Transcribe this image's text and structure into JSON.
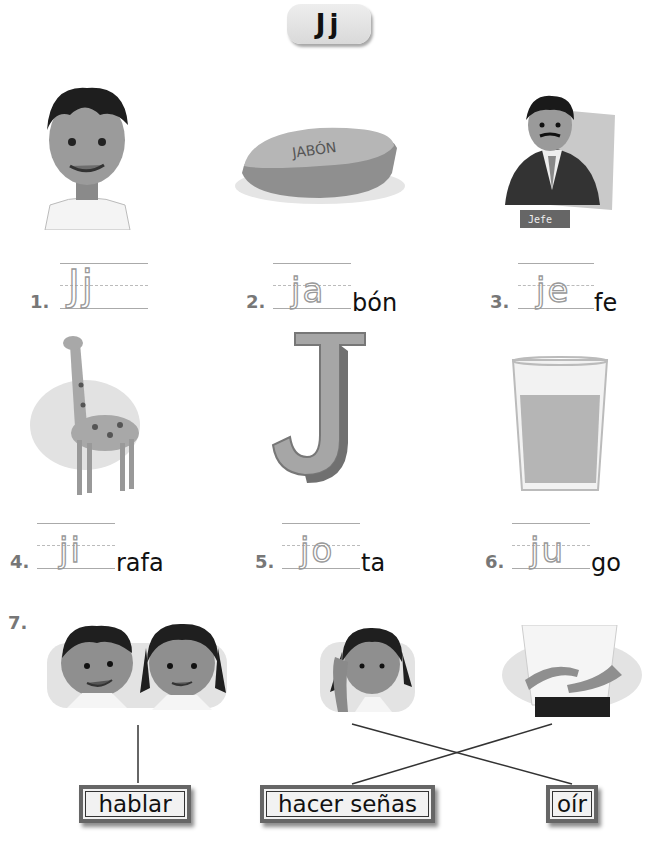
{
  "title": "Jj",
  "exercises": [
    {
      "number": "1.",
      "traced": "Jj",
      "suffix": "",
      "picture": "boy",
      "picture_label": ""
    },
    {
      "number": "2.",
      "traced": "ja",
      "suffix": "bón",
      "picture": "soap",
      "picture_label": "JABÓN"
    },
    {
      "number": "3.",
      "traced": "je",
      "suffix": "fe",
      "picture": "boss",
      "picture_label": "Jefe"
    },
    {
      "number": "4.",
      "traced": "ji",
      "suffix": "rafa",
      "picture": "giraffe",
      "picture_label": ""
    },
    {
      "number": "5.",
      "traced": "jo",
      "suffix": "ta",
      "picture": "letter-j",
      "picture_label": ""
    },
    {
      "number": "6.",
      "traced": "ju",
      "suffix": "go",
      "picture": "juice",
      "picture_label": ""
    }
  ],
  "matching": {
    "number": "7.",
    "pictures": [
      "children-talking",
      "girl-listening",
      "hands-signing"
    ],
    "words": [
      "hablar",
      "hacer señas",
      "oír"
    ],
    "connections": [
      {
        "picture": "children-talking",
        "word": "hablar"
      },
      {
        "picture": "girl-listening",
        "word": "oír"
      },
      {
        "picture": "hands-signing",
        "word": "hacer señas"
      }
    ]
  }
}
